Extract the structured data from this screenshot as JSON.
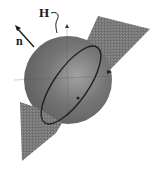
{
  "diagram": {
    "labels": {
      "H": "H",
      "n": "n"
    },
    "colors": {
      "sphere": "#6e6e6e",
      "sphere_highlight": "#9a9a9a",
      "plane": "#7a7a7a",
      "ellipse": "#2a1f1f",
      "background": "#ffffff",
      "ink": "#1a1a1a"
    }
  }
}
